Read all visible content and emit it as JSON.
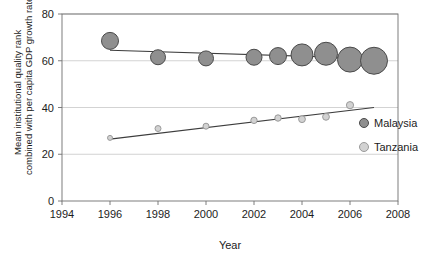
{
  "chart_data": {
    "type": "scatter",
    "title": "",
    "xlabel": "Year",
    "ylabel_line1": "Mean institutional quality rank",
    "ylabel_line2": "combined with per capita GDP growth rate",
    "xlim": [
      1994,
      2008
    ],
    "ylim": [
      0,
      80
    ],
    "xticks": [
      "1994",
      "1996",
      "1998",
      "2000",
      "2002",
      "2004",
      "2006",
      "2008"
    ],
    "yticks": [
      "0",
      "20",
      "40",
      "60",
      "80"
    ],
    "grid": "horizontal",
    "legend_position": "right",
    "series": [
      {
        "name": "Malaysia",
        "color": "#8f8f8f",
        "edge": "#4a4a4a",
        "points": [
          {
            "x": 1996,
            "y": 68.5,
            "r": 8.5
          },
          {
            "x": 1998,
            "y": 61.5,
            "r": 7.5
          },
          {
            "x": 2000,
            "y": 61.0,
            "r": 7.5
          },
          {
            "x": 2002,
            "y": 61.5,
            "r": 8.0
          },
          {
            "x": 2003,
            "y": 62.0,
            "r": 8.5
          },
          {
            "x": 2004,
            "y": 62.5,
            "r": 11.0
          },
          {
            "x": 2005,
            "y": 63.0,
            "r": 11.5
          },
          {
            "x": 2006,
            "y": 60.5,
            "r": 12.5
          },
          {
            "x": 2007,
            "y": 60.0,
            "r": 13.5
          }
        ],
        "trend": {
          "x1": 1996,
          "y1": 64.5,
          "x2": 2007,
          "y2": 61.0
        }
      },
      {
        "name": "Tanzania",
        "color": "#d2d2d2",
        "edge": "#9a9a9a",
        "points": [
          {
            "x": 1996,
            "y": 27.0,
            "r": 2.5
          },
          {
            "x": 1998,
            "y": 31.0,
            "r": 3.0
          },
          {
            "x": 2000,
            "y": 32.0,
            "r": 3.0
          },
          {
            "x": 2002,
            "y": 34.5,
            "r": 3.2
          },
          {
            "x": 2003,
            "y": 35.5,
            "r": 3.2
          },
          {
            "x": 2004,
            "y": 35.0,
            "r": 3.4
          },
          {
            "x": 2005,
            "y": 36.0,
            "r": 3.4
          },
          {
            "x": 2006,
            "y": 41.0,
            "r": 3.6
          }
        ],
        "trend": {
          "x1": 1996,
          "y1": 26.5,
          "x2": 2007,
          "y2": 40.0
        }
      }
    ]
  },
  "axes": {
    "x_title": "Year",
    "y_title_line1": "Mean institutional quality rank",
    "y_title_line2": "combined with per capita GDP growth rate",
    "x_ticks": [
      "1994",
      "1996",
      "1998",
      "2000",
      "2002",
      "2004",
      "2006",
      "2008"
    ],
    "y_ticks": [
      "80",
      "60",
      "40",
      "20",
      "0"
    ]
  },
  "legend": {
    "items": [
      {
        "label": "Malaysia",
        "color": "#8f8f8f"
      },
      {
        "label": "Tanzania",
        "color": "#d2d2d2"
      }
    ]
  },
  "colors": {
    "malaysia": "#8f8f8f",
    "tanzania": "#d2d2d2",
    "grid": "#c8c8c8",
    "axis": "#6f6f6f",
    "trend": "#3d3d3d"
  }
}
